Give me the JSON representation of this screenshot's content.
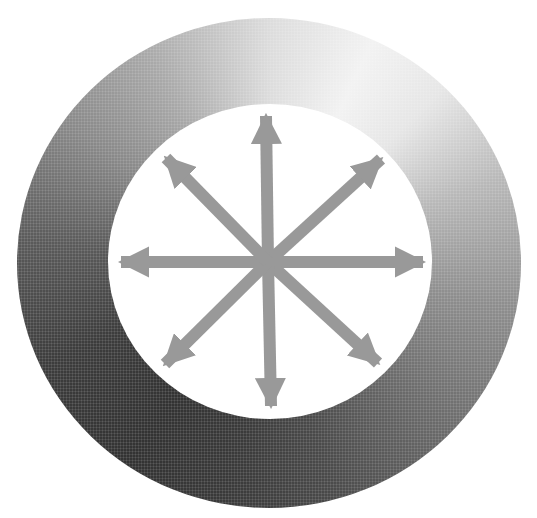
{
  "diagram": {
    "ring": {
      "outer_bounds": {
        "left": 17,
        "top": 18,
        "right": 521,
        "bottom": 508
      },
      "inner_bounds": {
        "left": 108,
        "top": 104,
        "right": 432,
        "bottom": 419
      },
      "gradient": {
        "lightest": "#f2f2f2",
        "lightest_position": "1 o'clock",
        "darkest": "#333333",
        "darkest_position": "7 o'clock"
      }
    },
    "arrows": {
      "color": "#999999",
      "count": 8,
      "center": {
        "x": 268,
        "y": 262
      },
      "shaft_width": 12,
      "items": [
        {
          "direction": "up",
          "tip": {
            "x": 266,
            "y": 116
          }
        },
        {
          "direction": "up-right",
          "tip": {
            "x": 381,
            "y": 159
          }
        },
        {
          "direction": "right",
          "tip": {
            "x": 423,
            "y": 262
          }
        },
        {
          "direction": "down-right",
          "tip": {
            "x": 378,
            "y": 363
          }
        },
        {
          "direction": "down",
          "tip": {
            "x": 271,
            "y": 406
          }
        },
        {
          "direction": "down-left",
          "tip": {
            "x": 165,
            "y": 364
          }
        },
        {
          "direction": "left",
          "tip": {
            "x": 121,
            "y": 262
          }
        },
        {
          "direction": "up-left",
          "tip": {
            "x": 166,
            "y": 158
          }
        }
      ]
    }
  }
}
